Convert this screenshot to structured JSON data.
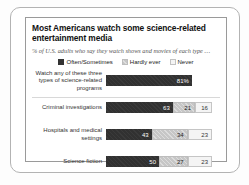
{
  "card": {
    "title": "Most Americans watch some science-related entertainment media",
    "subtitle": "% of U.S. adults who say they watch shows and movies of each type …"
  },
  "legend": {
    "items": [
      {
        "label": "Often/Sometimes",
        "swatch": "dark",
        "color": "#333333"
      },
      {
        "label": "Hardly ever",
        "swatch": "medium",
        "color": "#cccccc"
      },
      {
        "label": "Never",
        "swatch": "light",
        "color": "#f4f4f4"
      }
    ]
  },
  "rows": [
    {
      "label": "Watch any of these three types of science-related programs",
      "segments": [
        {
          "series": "Often/Sometimes",
          "value": 81,
          "display": "81%",
          "style": "dark"
        }
      ]
    },
    {
      "label": "Criminal investigations",
      "segments": [
        {
          "series": "Often/Sometimes",
          "value": 63,
          "display": "63",
          "style": "dark"
        },
        {
          "series": "Hardly ever",
          "value": 21,
          "display": "21",
          "style": "medium"
        },
        {
          "series": "Never",
          "value": 16,
          "display": "16",
          "style": "light"
        }
      ]
    },
    {
      "label": "Hospitals and medical settings",
      "segments": [
        {
          "series": "Often/Sometimes",
          "value": 43,
          "display": "43",
          "style": "dark"
        },
        {
          "series": "Hardly ever",
          "value": 34,
          "display": "34",
          "style": "medium"
        },
        {
          "series": "Never",
          "value": 23,
          "display": "23",
          "style": "light"
        }
      ]
    },
    {
      "label": "Science fiction",
      "segments": [
        {
          "series": "Often/Sometimes",
          "value": 50,
          "display": "50",
          "style": "dark"
        },
        {
          "series": "Hardly ever",
          "value": 27,
          "display": "27",
          "style": "medium"
        },
        {
          "series": "Never",
          "value": 23,
          "display": "23",
          "style": "light"
        }
      ]
    }
  ],
  "chart_data": {
    "type": "bar",
    "orientation": "horizontal",
    "stacked": true,
    "title": "Most Americans watch some science-related entertainment media",
    "subtitle": "% of U.S. adults who say they watch shows and movies of each type …",
    "categories": [
      "Watch any of these three types of science-related programs",
      "Criminal investigations",
      "Hospitals and medical settings",
      "Science fiction"
    ],
    "series": [
      {
        "name": "Often/Sometimes",
        "values": [
          81,
          63,
          43,
          50
        ],
        "color": "#333333"
      },
      {
        "name": "Hardly ever",
        "values": [
          null,
          21,
          34,
          27
        ],
        "color": "#cccccc"
      },
      {
        "name": "Never",
        "values": [
          null,
          16,
          23,
          23
        ],
        "color": "#f4f4f4"
      }
    ],
    "value_unit": "%",
    "xlim": [
      0,
      100
    ],
    "grid": false,
    "legend_position": "top",
    "data_labels": true
  }
}
